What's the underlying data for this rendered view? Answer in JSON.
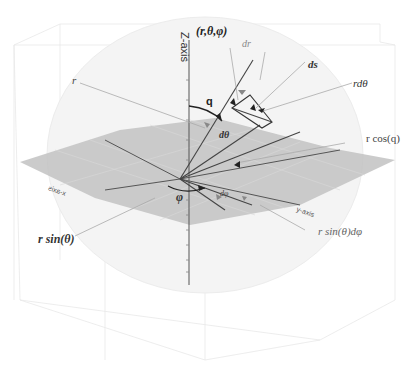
{
  "figure": {
    "axes": {
      "z_label": "Z-axis",
      "y_label": "y-axis",
      "x_label": "x-axis"
    },
    "labels": {
      "point": "(r,θ,φ)",
      "dr": "dr",
      "ds": "ds",
      "r_dtheta": "rdθ",
      "r": "r",
      "q": "q",
      "dtheta": "dθ",
      "r_cos_q": "r cos(q)",
      "phi": "φ",
      "dphi": "dφ",
      "r_sin_theta": "r sin(θ)",
      "r_sin_theta_dphi": "r sin(θ)dφ"
    },
    "colors": {
      "plane_fill": "#bdbdbd",
      "sphere_fill": "#f3f3f3",
      "line_dark": "#333333",
      "line_light": "#9a9a9a",
      "grid": "#e6e6e6",
      "text": "#222222",
      "text_light": "#777777"
    }
  }
}
